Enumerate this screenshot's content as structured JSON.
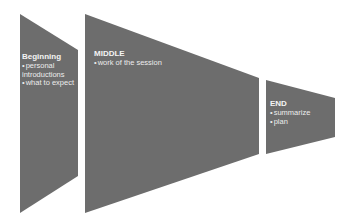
{
  "diagram": {
    "fill_color": "#6d6d6d",
    "text_color": "#ececec",
    "stages": [
      {
        "title": "Beginning",
        "items": [
          "personal introductions",
          "what to expect"
        ]
      },
      {
        "title": "MIDDLE",
        "items": [
          "work of the session"
        ]
      },
      {
        "title": "END",
        "items": [
          "summarize",
          "plan"
        ]
      }
    ]
  }
}
